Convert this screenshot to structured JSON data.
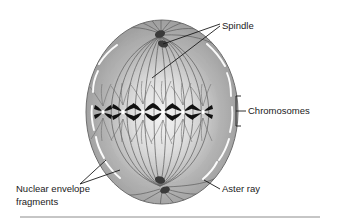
{
  "figure": {
    "background_color": "#ffffff",
    "cell": {
      "name": "animal-cell",
      "fill_edge_color": "#9a9a9a",
      "fill_center_color": "#f2f2f2",
      "outline_color": "#6e6e6e",
      "cx": 162,
      "cy": 112,
      "rx": 76,
      "ry": 92
    },
    "centrosomes": [
      {
        "name": "top-centrosome",
        "cx": 160,
        "cy": 34
      },
      {
        "name": "top-centriole",
        "cx": 163,
        "cy": 44
      },
      {
        "name": "bottom-centrosome",
        "cx": 160,
        "cy": 180
      },
      {
        "name": "bottom-centriole",
        "cx": 165,
        "cy": 190
      }
    ],
    "metaphase_plate": {
      "name": "metaphase-plate",
      "y": 112,
      "chromosome_color": "#111111",
      "centromere_color": "#ffffff",
      "chromosome_count": 6,
      "chromosome_x_positions": [
        103,
        123,
        143,
        163,
        183,
        203
      ]
    },
    "labels": [
      {
        "id": "spindle",
        "text": "Spindle",
        "x": 222,
        "y": 26,
        "anchor": "start",
        "lines": [
          {
            "from": [
              220,
              24
            ],
            "to": [
              163,
              44
            ]
          },
          {
            "from": [
              220,
              26
            ],
            "to": [
              152,
              78
            ]
          }
        ]
      },
      {
        "id": "chromosomes",
        "text": "Chromosomes",
        "x": 248,
        "y": 115,
        "anchor": "start",
        "bracket": {
          "x": 236,
          "y_top": 96,
          "y_bottom": 126,
          "tick": 5
        },
        "lines": [
          {
            "from": [
              236,
              111
            ],
            "to": [
              246,
              111
            ]
          }
        ]
      },
      {
        "id": "nuclear-envelope-fragments",
        "text": "Nuclear envelope",
        "text2": "fragments",
        "x": 16,
        "y": 192,
        "anchor": "start",
        "lines": [
          {
            "from": [
              80,
              184
            ],
            "to": [
              106,
              160
            ]
          },
          {
            "from": [
              80,
              184
            ],
            "to": [
              118,
              168
            ]
          }
        ]
      },
      {
        "id": "aster-ray",
        "text": "Aster ray",
        "x": 222,
        "y": 192,
        "anchor": "start",
        "lines": [
          {
            "from": [
              220,
              189
            ],
            "to": [
              205,
              180
            ]
          }
        ]
      }
    ],
    "footer_rule": {
      "name": "footer-divider",
      "x1": 20,
      "x2": 320,
      "y": 217,
      "color": "#808080"
    }
  }
}
